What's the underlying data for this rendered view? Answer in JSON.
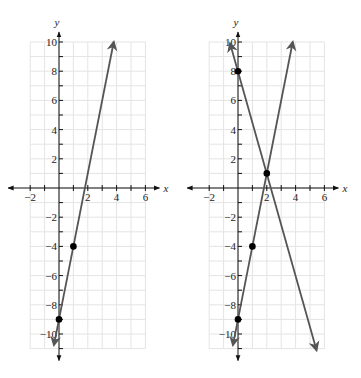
{
  "chart_data": [
    {
      "type": "line",
      "title": "",
      "xlabel": "x",
      "ylabel": "y",
      "xlim": [
        -2,
        6
      ],
      "ylim": [
        -11,
        10
      ],
      "grid": true,
      "x_ticks": [
        -2,
        2,
        4,
        6
      ],
      "y_ticks": [
        10,
        8,
        6,
        4,
        2,
        -2,
        -4,
        -6,
        -8,
        -10
      ],
      "series": [
        {
          "name": "y = 5x - 9",
          "slope": 5,
          "intercept": -9,
          "color": "#555555",
          "x": [
            -0.35,
            3.8
          ],
          "y": [
            -10.75,
            10
          ],
          "points": [
            [
              0,
              -9
            ],
            [
              1,
              -4
            ]
          ]
        }
      ]
    },
    {
      "type": "line",
      "title": "",
      "xlabel": "x",
      "ylabel": "y",
      "xlim": [
        -2,
        6
      ],
      "ylim": [
        -11,
        10
      ],
      "grid": true,
      "x_ticks": [
        -2,
        2,
        4,
        6
      ],
      "y_ticks": [
        10,
        8,
        6,
        4,
        2,
        -2,
        -4,
        -6,
        -8,
        -10
      ],
      "series": [
        {
          "name": "y = 5x - 9",
          "slope": 5,
          "intercept": -9,
          "color": "#555555",
          "x": [
            -0.35,
            3.8
          ],
          "y": [
            -10.75,
            10
          ],
          "points": [
            [
              0,
              -9
            ],
            [
              1,
              -4
            ]
          ]
        },
        {
          "name": "y = -3.5x + 8",
          "slope": -3.5,
          "intercept": 8,
          "color": "#555555",
          "x": [
            -0.55,
            5.45
          ],
          "y": [
            9.9,
            -11.1
          ],
          "points": [
            [
              0,
              8
            ],
            [
              2,
              1
            ]
          ]
        }
      ],
      "annotations": [
        {
          "label": "intersection",
          "x": 2,
          "y": 1
        }
      ]
    }
  ],
  "labels": {
    "x_axis": "x",
    "y_axis": "y"
  }
}
